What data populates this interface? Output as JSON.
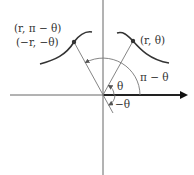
{
  "diagram": {
    "type": "polar-symmetry",
    "colors": {
      "axis": "#555555",
      "curve": "#333333",
      "ray": "#777777",
      "arc": "#777777",
      "point": "#333333",
      "text": "#333333"
    },
    "labels": {
      "point_right": "(r, θ)",
      "point_left_top": "(r, π − θ)",
      "point_left_bottom": "(−r, −θ)",
      "angle_theta": "θ",
      "angle_pi_minus_theta": "π − θ",
      "angle_neg_theta": "−θ"
    }
  }
}
